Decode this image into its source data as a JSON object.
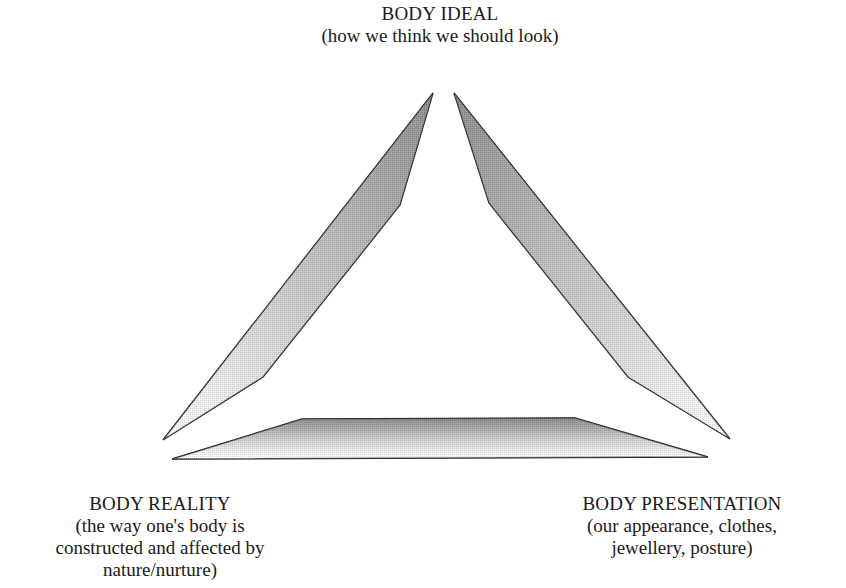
{
  "diagram": {
    "type": "triangle",
    "nodes": {
      "ideal": {
        "title": "BODY IDEAL",
        "description": "(how we think we should look)"
      },
      "reality": {
        "title": "BODY REALITY",
        "description_lines": [
          "(the way one's body is",
          "constructed and affected by",
          "nature/nurture)"
        ]
      },
      "presentation": {
        "title": "BODY PRESENTATION",
        "description_lines": [
          "(our appearance, clothes,",
          "jewellery, posture)"
        ]
      }
    },
    "edges": [
      {
        "from": "reality",
        "to": "ideal",
        "style": "shaded-wedge"
      },
      {
        "from": "ideal",
        "to": "presentation",
        "style": "shaded-wedge"
      },
      {
        "from": "reality",
        "to": "presentation",
        "style": "shaded-wedge"
      }
    ],
    "colors": {
      "stroke": "#1a1a1a",
      "shade_dark": "#6e6e6e",
      "shade_light": "#ffffff",
      "background": "#ffffff"
    }
  }
}
